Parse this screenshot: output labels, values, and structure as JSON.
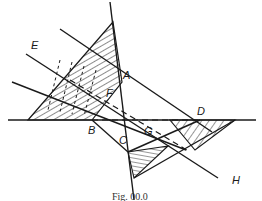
{
  "figure": {
    "caption": "Fig. 00.0",
    "stroke_color": "#1a1a1a",
    "background": "#ffffff"
  },
  "labels": {
    "A": "A",
    "B": "B",
    "C": "C",
    "D": "D",
    "E": "E",
    "F": "F",
    "G": "G",
    "H": "H"
  },
  "points": {
    "A": [
      121,
      80
    ],
    "B": [
      92,
      120
    ],
    "C": [
      128,
      152
    ],
    "D": [
      200,
      120
    ],
    "F": [
      114,
      98
    ],
    "G": [
      150,
      134
    ]
  }
}
